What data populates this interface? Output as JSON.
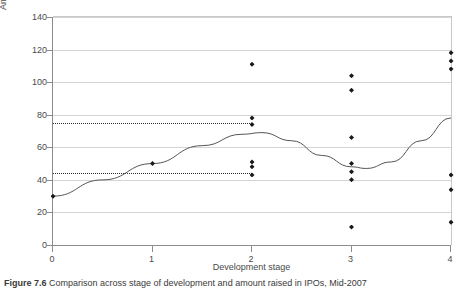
{
  "figure": {
    "caption_label": "Figure 7.6",
    "caption_text": "Comparison across stage of development and amount raised in IPOs, Mid-2007"
  },
  "chart_data": {
    "type": "scatter",
    "title": "",
    "xlabel": "Development stage",
    "ylabel": "Amount raised (US$ M)",
    "xlim": [
      0,
      4
    ],
    "ylim": [
      0,
      140
    ],
    "xticks": [
      0,
      1,
      2,
      3,
      4
    ],
    "yticks": [
      0,
      20,
      40,
      60,
      80,
      100,
      120,
      140
    ],
    "xtick_labels": [
      "0",
      "1",
      "2",
      "3",
      "4"
    ],
    "ytick_labels": [
      "0",
      "20",
      "40",
      "60",
      "80",
      "100",
      "120",
      "140"
    ],
    "grid": "horizontal",
    "legend": "none",
    "marker": "diamond",
    "marker_color": "#1a1a1a",
    "series": [
      {
        "name": "IPO observations",
        "type": "scatter",
        "points": [
          {
            "x": 0,
            "y": 30
          },
          {
            "x": 1,
            "y": 50
          },
          {
            "x": 2,
            "y": 111
          },
          {
            "x": 2,
            "y": 78
          },
          {
            "x": 2,
            "y": 74
          },
          {
            "x": 2,
            "y": 51
          },
          {
            "x": 2,
            "y": 48
          },
          {
            "x": 2,
            "y": 43
          },
          {
            "x": 3,
            "y": 104
          },
          {
            "x": 3,
            "y": 95
          },
          {
            "x": 3,
            "y": 66
          },
          {
            "x": 3,
            "y": 50
          },
          {
            "x": 3,
            "y": 45
          },
          {
            "x": 3,
            "y": 40
          },
          {
            "x": 3,
            "y": 11
          },
          {
            "x": 4,
            "y": 118
          },
          {
            "x": 4,
            "y": 113
          },
          {
            "x": 4,
            "y": 108
          },
          {
            "x": 4,
            "y": 43
          },
          {
            "x": 4,
            "y": 34
          },
          {
            "x": 4,
            "y": 14
          }
        ]
      },
      {
        "name": "Fitted trend curve",
        "type": "line",
        "line_color": "#555555",
        "points": [
          {
            "x": 0.0,
            "y": 30
          },
          {
            "x": 0.5,
            "y": 40
          },
          {
            "x": 1.0,
            "y": 50
          },
          {
            "x": 1.5,
            "y": 61
          },
          {
            "x": 1.9,
            "y": 68
          },
          {
            "x": 2.1,
            "y": 69
          },
          {
            "x": 2.4,
            "y": 64
          },
          {
            "x": 2.7,
            "y": 55
          },
          {
            "x": 3.0,
            "y": 48
          },
          {
            "x": 3.15,
            "y": 47
          },
          {
            "x": 3.4,
            "y": 51
          },
          {
            "x": 3.7,
            "y": 64
          },
          {
            "x": 4.0,
            "y": 78
          }
        ]
      }
    ],
    "reference_lines": [
      {
        "name": "upper-reference-line",
        "y": 75,
        "x_from": 0,
        "x_to": 2,
        "style": "dotted"
      },
      {
        "name": "lower-reference-line",
        "y": 44,
        "x_from": 0,
        "x_to": 2,
        "style": "dotted"
      }
    ]
  }
}
